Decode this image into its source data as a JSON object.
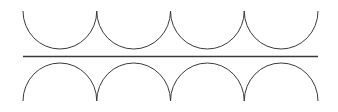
{
  "diagram": {
    "stroke_color": "#3a3a3a",
    "stroke_width": 1,
    "left": 23,
    "right": 318,
    "arc_count": 4,
    "top_row": {
      "orientation": "concave-up",
      "top_y": 11,
      "bottom_y": 49
    },
    "separator": {
      "y": 56
    },
    "bottom_row": {
      "orientation": "concave-down",
      "top_y": 63,
      "bottom_y": 101
    }
  }
}
